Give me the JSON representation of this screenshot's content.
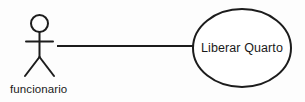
{
  "diagram": {
    "type": "uml-use-case-diagram",
    "background_color": "#fdfdfd",
    "stroke_color": "#1c1c1c",
    "text_color": "#1a1a1a",
    "actor": {
      "name": "funcionario",
      "label": "funcionario",
      "head": {
        "cx": 39.5,
        "cy": 23.5,
        "r": 8.5
      },
      "body": {
        "x": 39.5,
        "y1": 32,
        "y2": 57
      },
      "arms": {
        "y": 41.5,
        "x1": 26,
        "x2": 53
      },
      "leg_left": {
        "x1": 39.5,
        "y1": 57,
        "x2": 25,
        "y2": 76
      },
      "leg_right": {
        "x1": 39.5,
        "y1": 57,
        "x2": 54,
        "y2": 76
      },
      "label_x": 10,
      "label_y": 93
    },
    "use_case": {
      "name": "Liberar Quarto",
      "label": "Liberar Quarto",
      "ellipse": {
        "cx": 242,
        "cy": 48,
        "rx": 49,
        "ry": 39
      },
      "label_x": 242,
      "label_y": 52
    },
    "association": {
      "name": "actor-usecase-association",
      "x1": 57,
      "y1": 46,
      "x2": 194,
      "y2": 46
    }
  }
}
